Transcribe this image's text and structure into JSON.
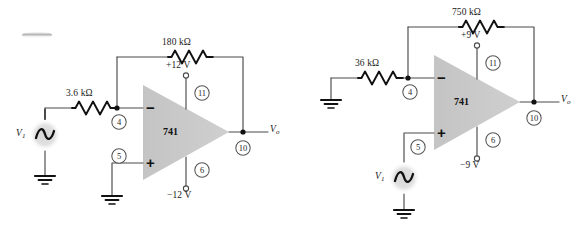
{
  "figure": {
    "background_color": "#ffffff",
    "wire_color": "#4a4a4a",
    "triangle_fill": "#c9c9c9",
    "source_glow": "#d8d8d8"
  },
  "circuits": [
    {
      "id": "left-circuit",
      "name": "inverting-amplifier",
      "chip_label": "741",
      "input_resistor": "3.6 kΩ",
      "feedback_resistor": "180 kΩ",
      "supply_positive": "+12 V",
      "supply_negative": "−12 V",
      "source_label": "V",
      "source_label_sub": "1",
      "output_label": "V",
      "output_label_sub": "o",
      "inverting_sign": "−",
      "noninverting_sign": "+",
      "pins": {
        "inverting": "4",
        "noninverting": "5",
        "supply_pos": "11",
        "supply_neg": "6",
        "output": "10"
      }
    },
    {
      "id": "right-circuit",
      "name": "noninverting-amplifier",
      "chip_label": "741",
      "input_resistor": "36 kΩ",
      "feedback_resistor": "750 kΩ",
      "supply_positive": "+9 V",
      "supply_negative": "−9 V",
      "source_label": "V",
      "source_label_sub": "1",
      "output_label": "V",
      "output_label_sub": "o",
      "inverting_sign": "−",
      "noninverting_sign": "+",
      "pins": {
        "inverting": "4",
        "noninverting": "5",
        "supply_pos": "11",
        "supply_neg": "6",
        "output": "10"
      }
    }
  ]
}
